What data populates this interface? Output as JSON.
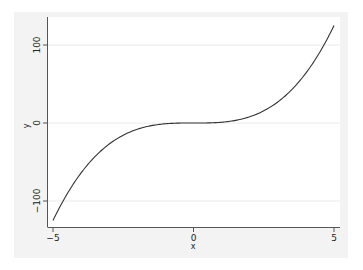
{
  "chart_data": {
    "type": "line",
    "title": "",
    "xlabel": "x",
    "ylabel": "y",
    "xlim": [
      -5,
      5
    ],
    "ylim": [
      -125,
      125
    ],
    "x_ticks": [
      -5,
      0,
      5
    ],
    "x_tick_labels": [
      "-5",
      "0",
      "5"
    ],
    "y_ticks": [
      -100,
      0,
      100
    ],
    "y_tick_labels": [
      "-100",
      "0",
      "100"
    ],
    "grid": "horizontal at y ticks (faint)",
    "legend": null,
    "function": "y = x^3",
    "series": [
      {
        "name": "y",
        "x": [
          -5,
          -4.5,
          -4,
          -3.5,
          -3,
          -2.5,
          -2,
          -1.5,
          -1,
          -0.5,
          0,
          0.5,
          1,
          1.5,
          2,
          2.5,
          3,
          3.5,
          4,
          4.5,
          5
        ],
        "values": [
          -125,
          -91.1,
          -64,
          -42.9,
          -27,
          -15.6,
          -8,
          -3.4,
          -1,
          -0.1,
          0,
          0.1,
          1,
          3.4,
          8,
          15.6,
          27,
          42.9,
          64,
          91.1,
          125
        ]
      }
    ]
  },
  "axes": {
    "xlabel": "x",
    "ylabel": "y",
    "x_tick_labels": [
      "−5",
      "0",
      "5"
    ],
    "y_tick_labels": [
      "−100",
      "0",
      "100"
    ]
  },
  "colors": {
    "graph_region": "#f3f3f3",
    "plot_region": "#ffffff",
    "line": "#333333",
    "gridline": "#eaeaea",
    "axis": "#555555"
  }
}
